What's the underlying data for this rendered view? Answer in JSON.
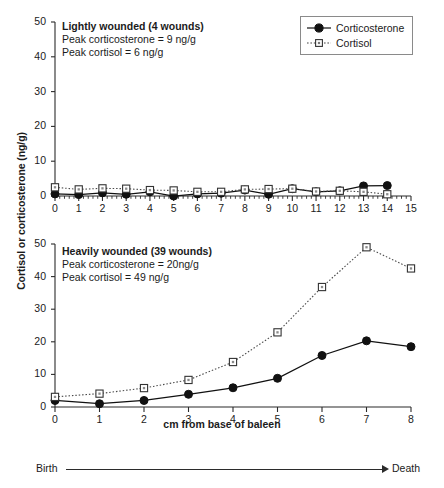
{
  "figure": {
    "ylabel": "Cortisol or corticosterone (ng/g)",
    "xlabel": "cm from base of baleen",
    "lifeline": {
      "start": "Birth",
      "end": "Death"
    }
  },
  "legend": {
    "position": "top-right",
    "items": [
      {
        "label": "Corticosterone",
        "marker": "filled-circle",
        "line": "solid",
        "color": "#111111"
      },
      {
        "label": "Cortisol",
        "marker": "open-square",
        "line": "dotted",
        "color": "#555555"
      }
    ]
  },
  "chart_data": [
    {
      "type": "line",
      "panel": "top",
      "title": "Lightly wounded (4 wounds)",
      "annotations": [
        "Peak corticosterone = 9 ng/g",
        "Peak cortisol = 6 ng/g"
      ],
      "xlabel": "",
      "ylabel": "Cortisol or corticosterone (ng/g)",
      "xlim": [
        0,
        15
      ],
      "ylim": [
        0,
        50
      ],
      "xticks": [
        0,
        1,
        2,
        3,
        4,
        5,
        6,
        7,
        8,
        9,
        10,
        11,
        12,
        13,
        14,
        15
      ],
      "yticks": [
        0,
        10,
        20,
        30,
        40,
        50
      ],
      "minor_xticks": true,
      "grid": false,
      "x": [
        0,
        1,
        2,
        3,
        4,
        5,
        6,
        7,
        8,
        9,
        10,
        11,
        12,
        13,
        14
      ],
      "series": [
        {
          "name": "Corticosterone",
          "marker": "filled-circle",
          "line": "solid",
          "values": [
            0.6,
            0.4,
            0.9,
            0.5,
            1.2,
            0.0,
            0.6,
            0.8,
            1.7,
            0.5,
            2.1,
            1.2,
            1.5,
            2.9,
            3.0
          ]
        },
        {
          "name": "Cortisol",
          "marker": "open-square",
          "line": "dotted",
          "values": [
            2.5,
            1.9,
            2.2,
            2.1,
            1.7,
            1.6,
            1.2,
            1.2,
            1.9,
            2.0,
            2.1,
            1.3,
            1.5,
            1.2,
            0.5
          ]
        }
      ]
    },
    {
      "type": "line",
      "panel": "bottom",
      "title": "Heavily wounded (39 wounds)",
      "annotations": [
        "Peak corticosterone = 20ng/g",
        "Peak cortisol = 49 ng/g"
      ],
      "xlabel": "cm from base of baleen",
      "ylabel": "Cortisol or corticosterone (ng/g)",
      "xlim": [
        0,
        8
      ],
      "ylim": [
        0,
        50
      ],
      "xticks": [
        0,
        1,
        2,
        3,
        4,
        5,
        6,
        7,
        8
      ],
      "yticks": [
        0,
        10,
        20,
        30,
        40,
        50
      ],
      "minor_xticks": false,
      "grid": false,
      "x": [
        0,
        1,
        2,
        3,
        4,
        5,
        6,
        7,
        8
      ],
      "series": [
        {
          "name": "Corticosterone",
          "marker": "filled-circle",
          "line": "solid",
          "values": [
            2.0,
            1.0,
            2.0,
            3.9,
            5.9,
            8.8,
            15.8,
            20.3,
            18.5
          ]
        },
        {
          "name": "Cortisol",
          "marker": "open-square",
          "line": "dotted",
          "values": [
            3.1,
            4.1,
            5.8,
            8.3,
            13.8,
            22.9,
            36.8,
            49.0,
            42.5
          ]
        }
      ]
    }
  ]
}
